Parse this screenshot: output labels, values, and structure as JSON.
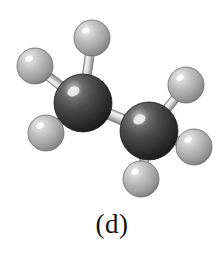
{
  "figure": {
    "caption": "(d)",
    "background_color": "#ffffff",
    "width": 224,
    "height": 253
  },
  "molecule": {
    "name": "ethane-ball-and-stick-model",
    "formula": "C2H6",
    "carbon_color": "#4a4a4a",
    "carbon_shadow_color": "#1d1d1d",
    "carbon_highlight_color": "#d8d8d8",
    "hydrogen_color": "#b9b9b9",
    "hydrogen_shadow_color": "#7d7d7d",
    "hydrogen_highlight_color": "#f2f2f2",
    "bond_color": "#cfcfcf",
    "bond_shadow_color": "#8e8e8e",
    "bond_highlight_color": "#f6f6f6",
    "outline_color": "#3a3a3a",
    "atoms": [
      {
        "id": "C1",
        "element": "C",
        "label": "carbon-left",
        "cx": 83,
        "cy": 103,
        "r": 29
      },
      {
        "id": "C2",
        "element": "C",
        "label": "carbon-right",
        "cx": 149,
        "cy": 131,
        "r": 29
      },
      {
        "id": "H1",
        "element": "H",
        "label": "hydrogen-top",
        "cx": 92,
        "cy": 38,
        "r": 18
      },
      {
        "id": "H2",
        "element": "H",
        "label": "hydrogen-upper-left",
        "cx": 35,
        "cy": 66,
        "r": 18
      },
      {
        "id": "H3",
        "element": "H",
        "label": "hydrogen-lower-left",
        "cx": 46,
        "cy": 133,
        "r": 18
      },
      {
        "id": "H4",
        "element": "H",
        "label": "hydrogen-upper-right",
        "cx": 186,
        "cy": 85,
        "r": 18
      },
      {
        "id": "H5",
        "element": "H",
        "label": "hydrogen-right",
        "cx": 194,
        "cy": 147,
        "r": 18
      },
      {
        "id": "H6",
        "element": "H",
        "label": "hydrogen-bottom",
        "cx": 141,
        "cy": 179,
        "r": 18
      }
    ],
    "bonds": [
      {
        "id": "B0",
        "label": "bond-carbon-carbon",
        "from": "C1",
        "to": "C2",
        "width": 11
      },
      {
        "id": "B1",
        "label": "bond-c1-h-top",
        "from": "C1",
        "to": "H1",
        "width": 9
      },
      {
        "id": "B2",
        "label": "bond-c1-h-upper-left",
        "from": "C1",
        "to": "H2",
        "width": 9
      },
      {
        "id": "B3",
        "label": "bond-c1-h-lower-left",
        "from": "C1",
        "to": "H3",
        "width": 9
      },
      {
        "id": "B4",
        "label": "bond-c2-h-upper-right",
        "from": "C2",
        "to": "H4",
        "width": 9
      },
      {
        "id": "B5",
        "label": "bond-c2-h-right",
        "from": "C2",
        "to": "H5",
        "width": 9
      },
      {
        "id": "B6",
        "label": "bond-c2-h-bottom",
        "from": "C2",
        "to": "H6",
        "width": 9
      }
    ]
  }
}
